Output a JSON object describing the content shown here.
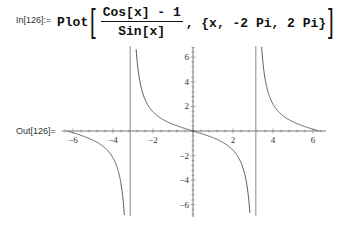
{
  "notebook": {
    "input": {
      "label": "In[126]:=",
      "function": "Plot",
      "numerator": "Cos[x] - 1",
      "denominator": "Sin[x]",
      "range": ", {x, -2 Pi, 2 Pi}"
    },
    "output": {
      "label": "Out[126]="
    }
  },
  "chart_data": {
    "type": "line",
    "title": "",
    "function": "(Cos[x] - 1)/Sin[x]",
    "xlabel": "",
    "ylabel": "",
    "xlim": [
      -6.5,
      6.5
    ],
    "ylim": [
      -6.9,
      6.9
    ],
    "x_ticks": [
      "-6",
      "-4",
      "-2",
      "2",
      "4",
      "6"
    ],
    "y_ticks": [
      "6",
      "4",
      "2",
      "-2",
      "-4",
      "-6"
    ],
    "x_range": [
      -6.2832,
      6.2832
    ],
    "asymptotes_x": [
      -3.1416,
      3.1416
    ],
    "grid": false,
    "series": [
      {
        "name": "(Cos[x]-1)/Sin[x]",
        "x": [
          -6.2832,
          -6.0,
          -5.5,
          -5.0,
          -4.5,
          -4.0,
          -3.6,
          -3.4,
          -3.3,
          -3.25,
          -3.2
        ],
        "values": [
          0.0,
          -0.142,
          -0.408,
          -0.744,
          -1.235,
          -2.161,
          -4.26,
          -7.0,
          null,
          null,
          null
        ]
      },
      {
        "name": "(Cos[x]-1)/Sin[x]",
        "x": [
          -3.0,
          -2.9,
          -2.8,
          -2.5,
          -2.0,
          -1.5,
          -1.0,
          -0.5,
          0.0,
          0.5,
          1.0,
          1.5,
          2.0,
          2.5,
          2.8,
          2.9,
          3.0
        ],
        "values": [
          7.0,
          8.2,
          5.7,
          3.4,
          1.557,
          0.932,
          0.546,
          0.255,
          0.0,
          -0.255,
          -0.546,
          -0.932,
          -1.557,
          -3.4,
          -5.7,
          -8.2,
          -7.0
        ]
      },
      {
        "name": "(Cos[x]-1)/Sin[x]",
        "x": [
          3.3,
          3.4,
          3.6,
          4.0,
          4.5,
          5.0,
          5.5,
          6.0,
          6.2832
        ],
        "values": [
          12.6,
          7.0,
          4.26,
          2.161,
          1.235,
          0.744,
          0.408,
          0.142,
          0.0
        ]
      }
    ]
  }
}
